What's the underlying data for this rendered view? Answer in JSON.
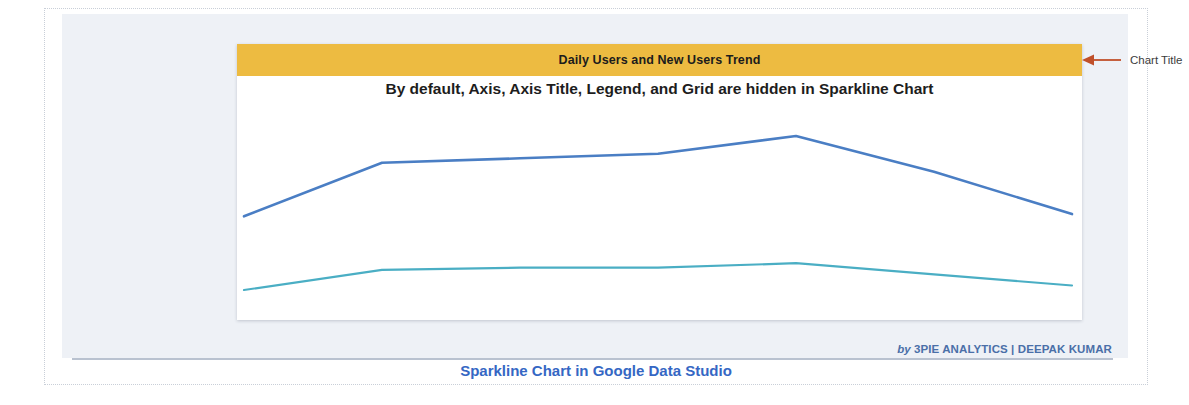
{
  "slide": {
    "caption": "Sparkline Chart in Google Data Studio",
    "credit_prefix": "by",
    "credit_name": "3PIE ANALYTICS | DEEPAK KUMAR"
  },
  "card": {
    "title": "Daily Users and New Users Trend",
    "subtitle": "By default, Axis, Axis Title, Legend, and Grid are hidden in Sparkline Chart"
  },
  "annotations": [
    {
      "label": "Chart Title",
      "icon": "left-arrow-icon",
      "color": "#c0502a"
    }
  ],
  "colors": {
    "title_band": "#edbb41",
    "series_daily_users": "#4a7ec4",
    "series_new_users": "#4aaec4",
    "panel_background": "#eef1f6",
    "caption_text": "#3567c4",
    "credit_text": "#4a6fa8",
    "annotation_arrow": "#c0502a"
  },
  "chart_data": {
    "type": "line",
    "title": "Daily Users and New Users Trend",
    "subtitle": "By default, Axis, Axis Title, Legend, and Grid are hidden in Sparkline Chart",
    "xlabel": "",
    "ylabel": "",
    "grid": false,
    "axis_visible": false,
    "legend_visible": false,
    "legend_position": "none",
    "x": [
      1,
      2,
      3,
      4,
      5,
      6,
      7
    ],
    "xlim": [
      1,
      7
    ],
    "ylim": [
      0,
      100
    ],
    "series": [
      {
        "name": "Daily Users",
        "color": "#4a7ec4",
        "values": [
          46,
          70,
          72,
          74,
          82,
          66,
          47
        ]
      },
      {
        "name": "New Users",
        "color": "#4aaec4",
        "values": [
          13,
          22,
          23,
          23,
          25,
          20,
          15
        ]
      }
    ]
  }
}
